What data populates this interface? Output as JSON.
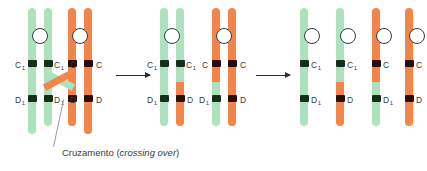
{
  "figure": {
    "caption_prefix": "Cruzamento (",
    "caption_italic": "crossing over",
    "caption_suffix": ")"
  },
  "colors": {
    "maternal_green": "#aee2bf",
    "paternal_orange": "#f4854a",
    "band_dark_green": "#14301c",
    "band_dark_brown": "#2a0d06",
    "centromere_fill": "#ffffff",
    "centromere_stroke": "#3b3b3b",
    "label_text": "#3b3b3b",
    "arrow": "#2d2d2d",
    "leader_line": "#9a9a9a",
    "background": "#ffffff"
  },
  "alleles": {
    "c_maternal": "C",
    "c_maternal_sub": "1",
    "c_paternal": "C",
    "d_maternal": "D",
    "d_maternal_sub": "1",
    "d_paternal": "D"
  },
  "stages": [
    {
      "name": "stage-1-crossing-over",
      "label": "Chiasma formation",
      "chromosomes": [
        {
          "name": "maternal-bivalent",
          "color": "green",
          "chromatids": [
            {
              "name": "chromatid-1",
              "upper_allele": "C1",
              "lower_allele": "D1",
              "upper_color": "green",
              "lower_color": "green"
            },
            {
              "name": "chromatid-2",
              "upper_allele": "C1",
              "lower_allele": "D1",
              "upper_color": "green",
              "lower_color": "green"
            }
          ]
        },
        {
          "name": "paternal-bivalent",
          "color": "orange",
          "chromatids": [
            {
              "name": "chromatid-3",
              "upper_allele": "C",
              "lower_allele": "D",
              "upper_color": "orange",
              "lower_color": "orange"
            },
            {
              "name": "chromatid-4",
              "upper_allele": "C",
              "lower_allele": "D",
              "upper_color": "orange",
              "lower_color": "orange"
            }
          ]
        }
      ]
    },
    {
      "name": "stage-2-recombined-bivalents",
      "label": "After exchange of segments",
      "chromosomes": [
        {
          "name": "maternal-bivalent-recombined",
          "color": "green",
          "chromatids": [
            {
              "name": "chromatid-1",
              "upper_allele": "C1",
              "lower_allele": "D1",
              "upper_color": "green",
              "lower_color": "green"
            },
            {
              "name": "chromatid-2",
              "upper_allele": "C1",
              "lower_allele": "D",
              "upper_color": "green",
              "lower_color": "orange"
            }
          ]
        },
        {
          "name": "paternal-bivalent-recombined",
          "color": "orange",
          "chromatids": [
            {
              "name": "chromatid-3",
              "upper_allele": "C",
              "lower_allele": "D1",
              "upper_color": "orange",
              "lower_color": "green"
            },
            {
              "name": "chromatid-4",
              "upper_allele": "C",
              "lower_allele": "D",
              "upper_color": "orange",
              "lower_color": "orange"
            }
          ]
        }
      ]
    },
    {
      "name": "stage-3-separated-chromatids",
      "label": "Four separated chromatids",
      "chromatids": [
        {
          "name": "chromatid-1",
          "upper_allele": "C1",
          "lower_allele": "D1",
          "upper_color": "green",
          "lower_color": "green"
        },
        {
          "name": "chromatid-2",
          "upper_allele": "C1",
          "lower_allele": "D",
          "upper_color": "green",
          "lower_color": "orange"
        },
        {
          "name": "chromatid-3",
          "upper_allele": "C",
          "lower_allele": "D1",
          "upper_color": "orange",
          "lower_color": "green"
        },
        {
          "name": "chromatid-4",
          "upper_allele": "C",
          "lower_allele": "D",
          "upper_color": "orange",
          "lower_color": "orange"
        }
      ]
    }
  ],
  "arrows": [
    {
      "name": "arrow-stage1-to-stage2"
    },
    {
      "name": "arrow-stage2-to-stage3"
    }
  ]
}
